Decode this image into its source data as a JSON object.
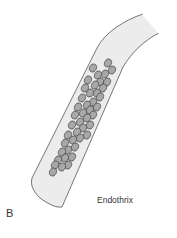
{
  "figure": {
    "panel_letter": "B",
    "caption": "Endothrix",
    "colors": {
      "shaft_fill": "#ececec",
      "shaft_stroke": "#555555",
      "spore_fill": "#a8a8a8",
      "spore_stroke": "#3a3a3a",
      "text": "#333333"
    },
    "spores": [
      [
        108,
        63
      ],
      [
        112,
        70
      ],
      [
        93,
        68
      ],
      [
        105,
        74
      ],
      [
        98,
        75
      ],
      [
        88,
        80
      ],
      [
        107,
        82
      ],
      [
        100,
        82
      ],
      [
        95,
        85
      ],
      [
        85,
        88
      ],
      [
        103,
        88
      ],
      [
        97,
        93
      ],
      [
        90,
        93
      ],
      [
        82,
        98
      ],
      [
        100,
        97
      ],
      [
        93,
        102
      ],
      [
        87,
        105
      ],
      [
        78,
        107
      ],
      [
        97,
        107
      ],
      [
        90,
        110
      ],
      [
        83,
        113
      ],
      [
        75,
        115
      ],
      [
        93,
        115
      ],
      [
        87,
        118
      ],
      [
        80,
        122
      ],
      [
        72,
        125
      ],
      [
        90,
        125
      ],
      [
        83,
        128
      ],
      [
        77,
        132
      ],
      [
        68,
        135
      ],
      [
        87,
        135
      ],
      [
        80,
        138
      ],
      [
        73,
        140
      ],
      [
        65,
        143
      ],
      [
        75,
        147
      ],
      [
        68,
        150
      ],
      [
        62,
        152
      ],
      [
        72,
        157
      ],
      [
        65,
        158
      ],
      [
        58,
        160
      ],
      [
        68,
        165
      ],
      [
        62,
        167
      ],
      [
        55,
        165
      ],
      [
        53,
        172
      ]
    ]
  }
}
